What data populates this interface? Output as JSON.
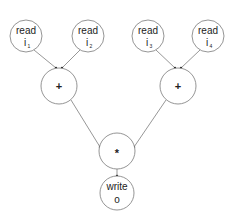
{
  "diagram": {
    "type": "dataflow-graph",
    "nodes": [
      {
        "id": "r1",
        "label": "read",
        "var": "i",
        "sub": "1",
        "cx": 26,
        "cy": 36,
        "r": 16
      },
      {
        "id": "r2",
        "label": "read",
        "var": "i",
        "sub": "2",
        "cx": 88,
        "cy": 36,
        "r": 16
      },
      {
        "id": "r3",
        "label": "read",
        "var": "i",
        "sub": "3",
        "cx": 148,
        "cy": 36,
        "r": 16
      },
      {
        "id": "r4",
        "label": "read",
        "var": "i",
        "sub": "4",
        "cx": 208,
        "cy": 36,
        "r": 16
      },
      {
        "id": "add1",
        "label": "+",
        "cx": 59,
        "cy": 86,
        "r": 18
      },
      {
        "id": "add2",
        "label": "+",
        "cx": 178,
        "cy": 86,
        "r": 18
      },
      {
        "id": "mul",
        "label": "*",
        "cx": 117,
        "cy": 151,
        "r": 18
      },
      {
        "id": "w",
        "label": "write",
        "var": "o",
        "cx": 117,
        "cy": 193,
        "r": 17
      }
    ],
    "edges": [
      {
        "from": "r1",
        "to": "add1"
      },
      {
        "from": "r2",
        "to": "add1"
      },
      {
        "from": "r3",
        "to": "add2"
      },
      {
        "from": "r4",
        "to": "add2"
      },
      {
        "from": "add1",
        "to": "mul"
      },
      {
        "from": "add2",
        "to": "mul"
      },
      {
        "from": "mul",
        "to": "w"
      }
    ]
  }
}
